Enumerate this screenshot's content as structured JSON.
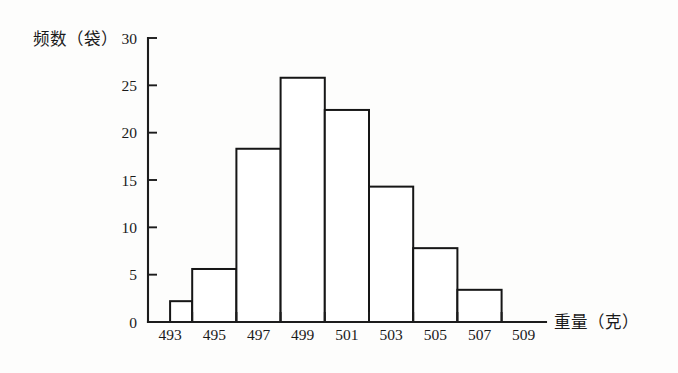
{
  "chart_data": {
    "type": "bar",
    "title": "",
    "subtitle": "",
    "xlabel": "重量（克）",
    "ylabel": "频数（袋）",
    "x_tick_labels": [
      "493",
      "495",
      "497",
      "499",
      "501",
      "503",
      "505",
      "507",
      "509"
    ],
    "y_tick_labels": [
      "0",
      "5",
      "10",
      "15",
      "20",
      "25",
      "30"
    ],
    "y_ticks": [
      0,
      5,
      10,
      15,
      20,
      25,
      30
    ],
    "ylim": [
      0,
      30
    ],
    "xlim": [
      493,
      511
    ],
    "bin_width": 2,
    "grid": false,
    "legend": false,
    "legend_position": "none",
    "bin_edges": [
      493,
      495,
      497,
      499,
      501,
      503,
      505,
      507,
      509
    ],
    "categories": [
      "493-495",
      "495-497",
      "497-499",
      "499-501",
      "501-503",
      "503-505",
      "505-507",
      "507-509"
    ],
    "values": [
      2.2,
      5.6,
      18.3,
      25.8,
      22.4,
      14.3,
      7.8,
      3.4
    ],
    "bars": [
      {
        "label": "493-495",
        "left": 494,
        "right": 495,
        "value": 2.2
      },
      {
        "label": "495-497",
        "left": 495,
        "right": 497,
        "value": 5.6
      },
      {
        "label": "497-499",
        "left": 497,
        "right": 499,
        "value": 18.3
      },
      {
        "label": "499-501",
        "left": 499,
        "right": 501,
        "value": 25.8
      },
      {
        "label": "501-503",
        "left": 501,
        "right": 503,
        "value": 22.4
      },
      {
        "label": "503-505",
        "left": 503,
        "right": 505,
        "value": 14.3
      },
      {
        "label": "505-507",
        "left": 505,
        "right": 507,
        "value": 7.8
      },
      {
        "label": "507-509",
        "left": 507,
        "right": 509,
        "value": 3.4
      }
    ],
    "colors": {
      "bar_fill": "#ffffff",
      "bar_stroke": "#161616",
      "axis": "#1c1c1c",
      "text": "#1a1a1a",
      "background": "#fdfdfc"
    }
  }
}
